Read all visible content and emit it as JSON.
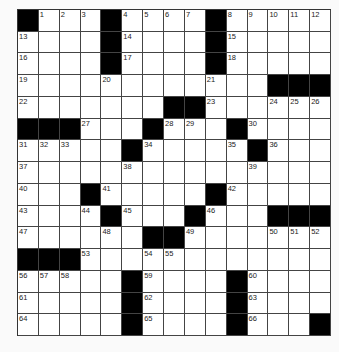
{
  "puzzle": {
    "rows": 15,
    "cols": 15,
    "colors": {
      "black": "#000000",
      "white": "#ffffff",
      "line": "#444444"
    },
    "grid": [
      [
        "#",
        "1",
        "2",
        "3",
        "#",
        "4",
        "5",
        "6",
        "7",
        "#",
        "8",
        "9",
        "10",
        "11",
        "12"
      ],
      [
        "13",
        "",
        "",
        "",
        "#",
        "14",
        "",
        "",
        "",
        "#",
        "15",
        "",
        "",
        "",
        ""
      ],
      [
        "16",
        "",
        "",
        "",
        "#",
        "17",
        "",
        "",
        "",
        "#",
        "18",
        "",
        "",
        "",
        ""
      ],
      [
        "19",
        "",
        "",
        "",
        "20",
        "",
        "",
        "",
        "",
        "21",
        "",
        "",
        "#",
        "#",
        "#"
      ],
      [
        "22",
        "",
        "",
        "",
        "",
        "",
        "",
        "#",
        "#",
        "23",
        "",
        "",
        "24",
        "25",
        "26"
      ],
      [
        "#",
        "#",
        "#",
        "27",
        "",
        "",
        "#",
        "28",
        "29",
        "",
        "#",
        "30",
        "",
        "",
        ""
      ],
      [
        "31",
        "32",
        "33",
        "",
        "",
        "#",
        "34",
        "",
        "",
        "",
        "35",
        "#",
        "36",
        "",
        ""
      ],
      [
        "37",
        "",
        "",
        "",
        "",
        "38",
        "",
        "",
        "",
        "",
        "",
        "39",
        "",
        "",
        ""
      ],
      [
        "40",
        "",
        "",
        "#",
        "41",
        "",
        "",
        "",
        "",
        "#",
        "42",
        "",
        "",
        "",
        ""
      ],
      [
        "43",
        "",
        "",
        "44",
        "#",
        "45",
        "",
        "",
        "#",
        "46",
        "",
        "",
        "#",
        "#",
        "#"
      ],
      [
        "47",
        "",
        "",
        "",
        "48",
        "",
        "#",
        "#",
        "49",
        "",
        "",
        "",
        "50",
        "51",
        "52"
      ],
      [
        "#",
        "#",
        "#",
        "53",
        "",
        "",
        "54",
        "55",
        "",
        "",
        "",
        "",
        "",
        "",
        ""
      ],
      [
        "56",
        "57",
        "58",
        "",
        "",
        "#",
        "59",
        "",
        "",
        "",
        "#",
        "60",
        "",
        "",
        ""
      ],
      [
        "61",
        "",
        "",
        "",
        "",
        "#",
        "62",
        "",
        "",
        "",
        "#",
        "63",
        "",
        "",
        ""
      ],
      [
        "64",
        "",
        "",
        "",
        "",
        "#",
        "65",
        "",
        "",
        "",
        "#",
        "66",
        "",
        "",
        "#"
      ]
    ]
  }
}
